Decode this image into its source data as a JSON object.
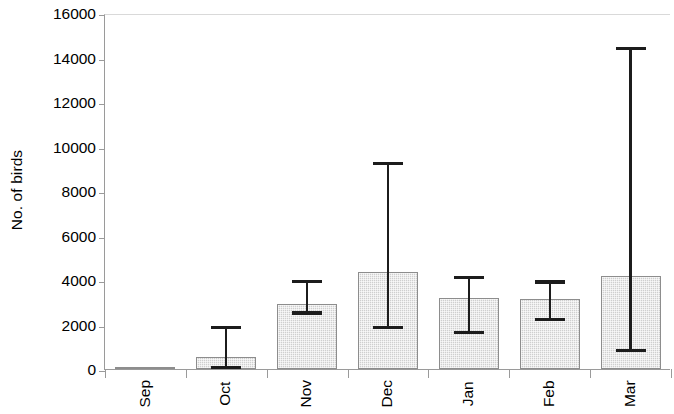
{
  "chart_data": {
    "type": "bar",
    "title": "",
    "subtitle": "",
    "xlabel": "",
    "ylabel": "No. of birds",
    "ylim": [
      0,
      16000
    ],
    "ytick_labels": [
      "0",
      "2000",
      "4000",
      "6000",
      "8000",
      "10000",
      "12000",
      "14000",
      "16000"
    ],
    "ytick_values": [
      0,
      2000,
      4000,
      6000,
      8000,
      10000,
      12000,
      14000,
      16000
    ],
    "grid": false,
    "legend": null,
    "error_bars": true,
    "categories": [
      "Sep",
      "Oct",
      "Nov",
      "Dec",
      "Jan",
      "Feb",
      "Mar"
    ],
    "values": [
      90,
      520,
      2900,
      4350,
      3200,
      3130,
      4200
    ],
    "error_low": [
      90,
      0,
      2450,
      1800,
      1580,
      2150,
      760
    ],
    "error_high": [
      90,
      1940,
      4000,
      9300,
      4180,
      3980,
      14470
    ],
    "colors": {
      "bar_fill": "#cfcfcf",
      "bar_edge": "#8d8d8d",
      "error_bar": "#1c1c1c",
      "axis": "#9a9a9a",
      "text": "#000000",
      "background": "#ffffff"
    }
  },
  "axes": {
    "y_title": "No. of birds",
    "y_ticks": [
      {
        "label": "16000",
        "value": 16000
      },
      {
        "label": "14000",
        "value": 14000
      },
      {
        "label": "12000",
        "value": 12000
      },
      {
        "label": "10000",
        "value": 10000
      },
      {
        "label": "8000",
        "value": 8000
      },
      {
        "label": "6000",
        "value": 6000
      },
      {
        "label": "4000",
        "value": 4000
      },
      {
        "label": "2000",
        "value": 2000
      },
      {
        "label": "0",
        "value": 0
      }
    ],
    "x_ticks": [
      {
        "label": "Sep"
      },
      {
        "label": "Oct"
      },
      {
        "label": "Nov"
      },
      {
        "label": "Dec"
      },
      {
        "label": "Jan"
      },
      {
        "label": "Feb"
      },
      {
        "label": "Mar"
      }
    ]
  }
}
